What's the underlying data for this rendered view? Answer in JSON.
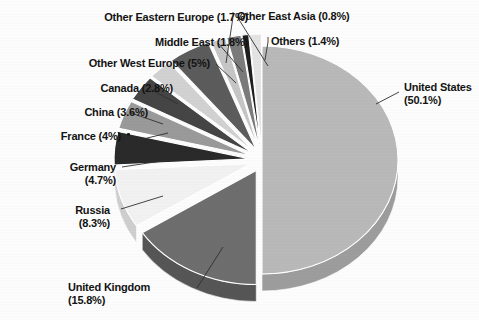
{
  "chart_data": {
    "type": "pie",
    "title": "",
    "subtitle": "",
    "xlabel": "",
    "ylabel": "",
    "legend_position": "none",
    "grid": false,
    "label_format": "{name} ({value}%)",
    "exploded": true,
    "three_d": true,
    "categories": [
      "United States",
      "United Kingdom",
      "Russia",
      "Germany",
      "France",
      "China",
      "Canada",
      "Other West Europe",
      "Middle East",
      "Other Eastern Europe",
      "Other East Asia",
      "Others"
    ],
    "values": [
      50.1,
      15.8,
      8.3,
      4.7,
      4.0,
      3.6,
      2.8,
      5.0,
      1.8,
      1.7,
      0.8,
      1.4
    ],
    "slices": [
      {
        "name": "United States",
        "value": 50.1,
        "label": "United States",
        "pct_text": "(50.1%)",
        "color": "#b9b9b9",
        "side_color": "#9d9d9d"
      },
      {
        "name": "United Kingdom",
        "value": 15.8,
        "label": "United Kingdom",
        "pct_text": "(15.8%)",
        "color": "#6e6e6e",
        "side_color": "#565656"
      },
      {
        "name": "Russia",
        "value": 8.3,
        "label": "Russia",
        "pct_text": "(8.3%)",
        "color": "#f2f2f2",
        "side_color": "#cfcfcf"
      },
      {
        "name": "Germany",
        "value": 4.7,
        "label": "Germany",
        "pct_text": "(4.7%)",
        "color": "#2a2a2a",
        "side_color": "#161616"
      },
      {
        "name": "France",
        "value": 4.0,
        "label": "France",
        "pct_text": "(4%)",
        "color": "#9a9a9a",
        "side_color": "#7d7d7d"
      },
      {
        "name": "China",
        "value": 3.6,
        "label": "China",
        "pct_text": "(3.6%)",
        "color": "#454545",
        "side_color": "#2e2e2e"
      },
      {
        "name": "Canada",
        "value": 2.8,
        "label": "Canada",
        "pct_text": "(2.8%)",
        "color": "#d2d2d2",
        "side_color": "#b2b2b2"
      },
      {
        "name": "Other West Europe",
        "value": 5.0,
        "label": "Other West Europe",
        "pct_text": "(5%)",
        "color": "#5c5c5c",
        "side_color": "#454545"
      },
      {
        "name": "Middle East",
        "value": 1.8,
        "label": "Middle East",
        "pct_text": "(1.8%)",
        "color": "#c6c6c6",
        "side_color": "#a6a6a6"
      },
      {
        "name": "Other Eastern Europe",
        "value": 1.7,
        "label": "Other Eastern Europe",
        "pct_text": "(1.7%)",
        "color": "#7b7b7b",
        "side_color": "#616161"
      },
      {
        "name": "Other East Asia",
        "value": 0.8,
        "label": "Other East Asia",
        "pct_text": "(0.8%)",
        "color": "#1e1e1e",
        "side_color": "#101010"
      },
      {
        "name": "Others",
        "value": 1.4,
        "label": "Others",
        "pct_text": "(1.4%)",
        "color": "#e4e4e4",
        "side_color": "#c4c4c4"
      }
    ]
  },
  "labels": {
    "united_states": "United States\n(50.1%)",
    "united_kingdom": "United Kingdom\n(15.8%)",
    "russia": "Russia\n(8.3%)",
    "germany": "Germany\n(4.7%)",
    "france": "France (4%)",
    "china": "China (3.6%)",
    "canada": "Canada (2.8%)",
    "other_west_europe": "Other West Europe (5%)",
    "middle_east": "Middle East (1.8%)",
    "other_eastern_europe": "Other Eastern Europe (1.7%)",
    "other_east_asia": "Other East Asia (0.8%)",
    "others": "Others (1.4%)"
  },
  "colors": {
    "background": "#fdfdfd",
    "text": "#131313",
    "leader_line": "#303030"
  }
}
